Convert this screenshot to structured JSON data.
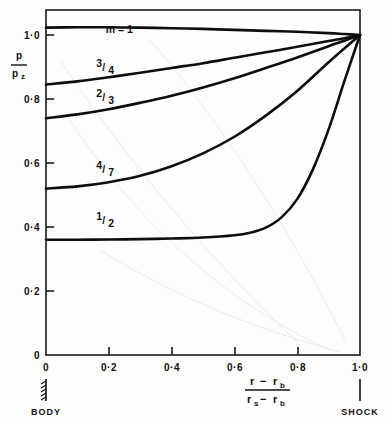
{
  "figure": {
    "background_color": "#fdfdfd",
    "ink_color": "#0d0d0d",
    "y_axis_label_numerator": "p",
    "y_axis_label_denominator": "pz",
    "y_axis_label_denominator_main": "p",
    "y_axis_label_denominator_sub": "z",
    "x_axis_label_num_a": "r",
    "x_axis_label_num_minus": "−",
    "x_axis_label_num_b": "r",
    "x_axis_label_num_b_sub": "b",
    "x_axis_label_den_a": "r",
    "x_axis_label_den_a_sub": "s",
    "x_axis_label_den_minus": "−",
    "x_axis_label_den_b": "r",
    "x_axis_label_den_b_sub": "b",
    "left_boundary_label": "BODY",
    "right_boundary_label": "SHOCK"
  },
  "chart_data": {
    "type": "line",
    "title": "",
    "xlabel": "(r − r_b) / (r_s − r_b)",
    "ylabel": "p / p_z",
    "xlim": [
      0,
      1.0
    ],
    "ylim": [
      0,
      1.08
    ],
    "grid": false,
    "legend_position": "inline-curve-labels",
    "x_ticks": [
      0,
      0.2,
      0.4,
      0.6,
      0.8,
      1.0
    ],
    "x_tick_labels": [
      "0",
      "0·0·2",
      "0·4",
      "0·6",
      "0·8",
      "1·0"
    ],
    "x_tick_labels_display": [
      "0",
      "0·2",
      "0·4",
      "0·6",
      "0·8",
      "1·0"
    ],
    "y_ticks": [
      0,
      0.2,
      0.4,
      0.6,
      0.8,
      1.0
    ],
    "y_tick_labels": [
      "0",
      "0·2",
      "0·4",
      "0·6",
      "0·8",
      "1·0"
    ],
    "annotations": [
      {
        "text": "BODY",
        "x": 0,
        "position": "below-axis-left"
      },
      {
        "text": "SHOCK",
        "x": 1.0,
        "position": "below-axis-right"
      }
    ],
    "series": [
      {
        "name": "m = 1",
        "label": "m = 1",
        "label_x": 0.19,
        "label_y": 1.005,
        "x": [
          0.0,
          0.1,
          0.2,
          0.3,
          0.4,
          0.5,
          0.6,
          0.7,
          0.8,
          0.9,
          0.95,
          1.0
        ],
        "values": [
          1.023,
          1.024,
          1.024,
          1.023,
          1.021,
          1.019,
          1.016,
          1.013,
          1.01,
          1.006,
          1.003,
          1.0
        ]
      },
      {
        "name": "3/4",
        "label": "3/4",
        "label_numerator": "3",
        "label_denominator": "4",
        "label_x": 0.16,
        "label_y": 0.895,
        "x": [
          0.0,
          0.1,
          0.2,
          0.3,
          0.4,
          0.5,
          0.6,
          0.7,
          0.8,
          0.9,
          0.95,
          1.0
        ],
        "values": [
          0.845,
          0.855,
          0.868,
          0.882,
          0.897,
          0.912,
          0.929,
          0.946,
          0.963,
          0.981,
          0.99,
          1.0
        ]
      },
      {
        "name": "2/3",
        "label": "2/3",
        "label_numerator": "2",
        "label_denominator": "3",
        "label_x": 0.16,
        "label_y": 0.8,
        "x": [
          0.0,
          0.1,
          0.2,
          0.3,
          0.4,
          0.5,
          0.6,
          0.7,
          0.8,
          0.9,
          0.95,
          1.0
        ],
        "values": [
          0.74,
          0.752,
          0.768,
          0.788,
          0.81,
          0.836,
          0.865,
          0.897,
          0.93,
          0.965,
          0.982,
          1.0
        ]
      },
      {
        "name": "4/7",
        "label": "4/7",
        "label_numerator": "4",
        "label_denominator": "7",
        "label_x": 0.16,
        "label_y": 0.575,
        "x": [
          0.0,
          0.1,
          0.2,
          0.3,
          0.4,
          0.5,
          0.6,
          0.7,
          0.8,
          0.9,
          0.95,
          1.0
        ],
        "values": [
          0.52,
          0.527,
          0.54,
          0.56,
          0.59,
          0.63,
          0.682,
          0.748,
          0.825,
          0.915,
          0.958,
          1.0
        ]
      },
      {
        "name": "1/2",
        "label": "1/2",
        "label_numerator": "1",
        "label_denominator": "2",
        "label_x": 0.16,
        "label_y": 0.415,
        "x": [
          0.0,
          0.1,
          0.2,
          0.3,
          0.4,
          0.5,
          0.6,
          0.65,
          0.7,
          0.75,
          0.8,
          0.85,
          0.9,
          0.95,
          1.0
        ],
        "values": [
          0.36,
          0.36,
          0.361,
          0.362,
          0.364,
          0.367,
          0.374,
          0.382,
          0.398,
          0.43,
          0.487,
          0.58,
          0.705,
          0.855,
          1.0
        ]
      }
    ]
  }
}
